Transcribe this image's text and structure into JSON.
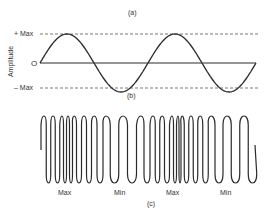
{
  "panel_a": {
    "label": "(a)"
  },
  "panel_b": {
    "label": "(b)",
    "ylabel": "Amplitude",
    "ticks": {
      "max": "+ Max",
      "zero": "O",
      "min": "– Max"
    },
    "cycles": 2
  },
  "panel_c": {
    "label": "(c)",
    "annotations": [
      "Max",
      "Min",
      "Max",
      "Min"
    ],
    "peak_x": [
      44,
      53,
      62,
      68,
      74,
      84,
      94,
      106,
      123,
      141,
      153,
      162,
      172,
      178,
      182,
      191,
      200,
      211,
      227,
      244
    ]
  },
  "colors": {
    "line": "#2a2a2a",
    "dash": "#555555"
  }
}
